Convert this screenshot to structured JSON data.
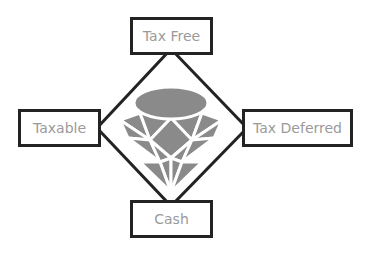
{
  "diagram": {
    "center_icon": "gem-icon",
    "nodes": [
      {
        "id": "top",
        "label": "Tax Free"
      },
      {
        "id": "left",
        "label": "Taxable"
      },
      {
        "id": "right",
        "label": "Tax Deferred"
      },
      {
        "id": "bottom",
        "label": "Cash"
      }
    ],
    "colors": {
      "border": "#232323",
      "text": "#9a9a9a",
      "gem_fill": "#8a8a8a",
      "background": "#ffffff"
    }
  }
}
